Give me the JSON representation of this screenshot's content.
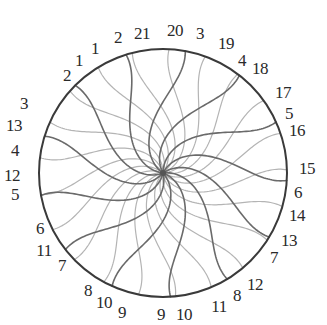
{
  "diagram": {
    "type": "phyllotaxis-spiral-circle",
    "center": [
      163,
      173
    ],
    "radius": 124,
    "colors": {
      "rim": "#3a3a3a",
      "spiral_dark": "#6a6a6a",
      "spiral_light": "#b4b4b4",
      "center": "#555555",
      "label": "#2a2a2a",
      "background": "#ffffff"
    },
    "spiral_families": [
      {
        "name": "dark-spirals",
        "count": 13,
        "direction": "clockwise",
        "color_key": "spiral_dark",
        "stroke_width": 1.6
      },
      {
        "name": "light-spirals",
        "count": 21,
        "direction": "counterclockwise",
        "color_key": "spiral_light",
        "stroke_width": 1.2
      }
    ],
    "labels": [
      {
        "text": "2",
        "x": 67,
        "y": 75
      },
      {
        "text": "1",
        "x": 79,
        "y": 60
      },
      {
        "text": "1",
        "x": 95,
        "y": 48
      },
      {
        "text": "2",
        "x": 118,
        "y": 37
      },
      {
        "text": "21",
        "x": 142,
        "y": 33
      },
      {
        "text": "20",
        "x": 175,
        "y": 30
      },
      {
        "text": "3",
        "x": 200,
        "y": 33
      },
      {
        "text": "19",
        "x": 226,
        "y": 43
      },
      {
        "text": "4",
        "x": 242,
        "y": 60
      },
      {
        "text": "18",
        "x": 260,
        "y": 68
      },
      {
        "text": "17",
        "x": 283,
        "y": 92
      },
      {
        "text": "5",
        "x": 289,
        "y": 113
      },
      {
        "text": "16",
        "x": 297,
        "y": 130
      },
      {
        "text": "15",
        "x": 307,
        "y": 168
      },
      {
        "text": "6",
        "x": 298,
        "y": 192
      },
      {
        "text": "14",
        "x": 297,
        "y": 215
      },
      {
        "text": "13",
        "x": 289,
        "y": 240
      },
      {
        "text": "7",
        "x": 274,
        "y": 257
      },
      {
        "text": "12",
        "x": 255,
        "y": 284
      },
      {
        "text": "8",
        "x": 237,
        "y": 295
      },
      {
        "text": "11",
        "x": 219,
        "y": 306
      },
      {
        "text": "10",
        "x": 184,
        "y": 314
      },
      {
        "text": "9",
        "x": 161,
        "y": 314
      },
      {
        "text": "9",
        "x": 122,
        "y": 312
      },
      {
        "text": "10",
        "x": 104,
        "y": 302
      },
      {
        "text": "8",
        "x": 88,
        "y": 290
      },
      {
        "text": "7",
        "x": 62,
        "y": 265
      },
      {
        "text": "11",
        "x": 44,
        "y": 250
      },
      {
        "text": "6",
        "x": 40,
        "y": 228
      },
      {
        "text": "5",
        "x": 15,
        "y": 194
      },
      {
        "text": "12",
        "x": 12,
        "y": 175
      },
      {
        "text": "4",
        "x": 15,
        "y": 150
      },
      {
        "text": "13",
        "x": 14,
        "y": 125
      },
      {
        "text": "3",
        "x": 24,
        "y": 103
      }
    ]
  }
}
